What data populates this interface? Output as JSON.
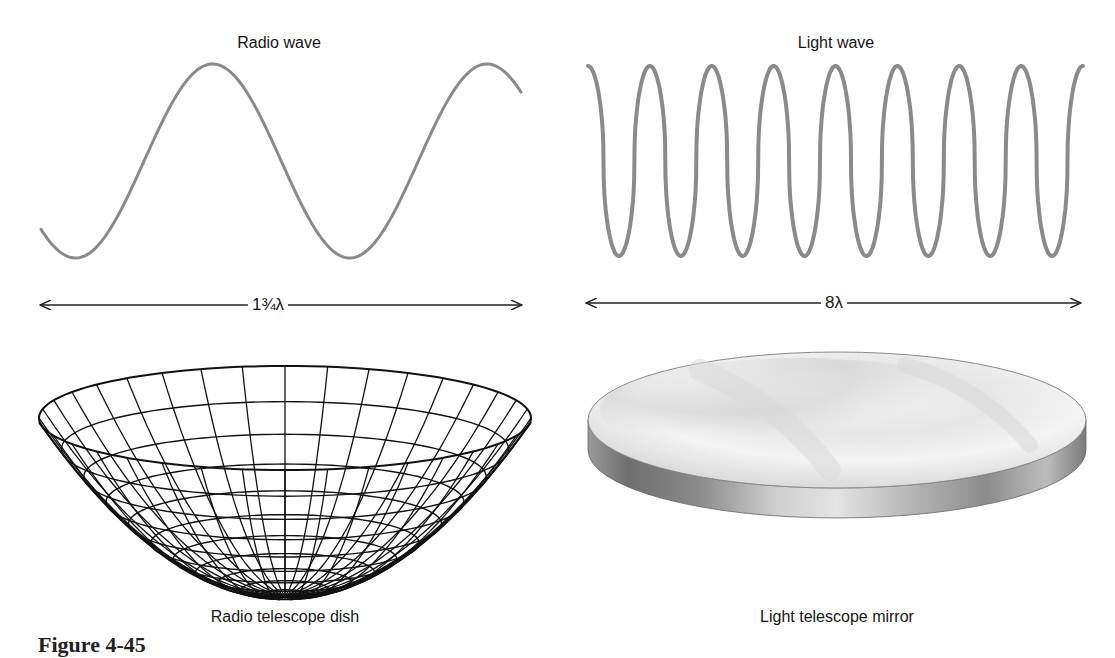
{
  "figure": {
    "caption_partial": "Figure 4-45",
    "panels": {
      "radio_wave": {
        "title": "Radio wave",
        "span_label": "1¾λ",
        "cycles": 1.75,
        "stroke_color": "#8a8a8a"
      },
      "light_wave": {
        "title": "Light wave",
        "span_label": "8λ",
        "cycles": 8,
        "stroke_color": "#8a8a8a"
      },
      "radio_dish": {
        "caption": "Radio telescope dish",
        "style": "wireframe paraboloid",
        "line_color": "#111111"
      },
      "light_mirror": {
        "caption": "Light telescope mirror",
        "style": "polished concave disc",
        "surface_color": "#e6e6e6",
        "edge_color": "#8c8c8c"
      }
    },
    "icons": {
      "arrow_left": "double-headed-arrow-left-tip",
      "arrow_right": "double-headed-arrow-right-tip"
    }
  }
}
